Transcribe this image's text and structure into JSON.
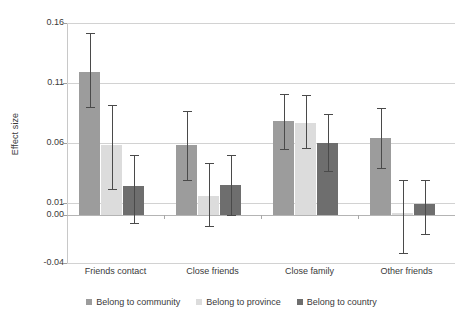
{
  "chart_data": {
    "type": "bar",
    "title": "",
    "xlabel": "",
    "ylabel": "Effect size",
    "categories": [
      "Friends contact",
      "Close friends",
      "Close family",
      "Other friends"
    ],
    "yticks": [
      "0.16",
      "0.11",
      "0.06",
      "0.01",
      "0.00",
      "-0.04"
    ],
    "ytick_values": [
      0.16,
      0.11,
      0.06,
      0.01,
      0.0,
      -0.04
    ],
    "ylim": [
      -0.04,
      0.16
    ],
    "grid": true,
    "legend_position": "bottom",
    "error_bars": "95% confidence interval",
    "series": [
      {
        "name": "Belong to community",
        "color": "#9c9c9c",
        "values": [
          0.119,
          0.058,
          0.078,
          0.064
        ],
        "ci_low": [
          0.09,
          0.029,
          0.055,
          0.039
        ],
        "ci_high": [
          0.152,
          0.087,
          0.101,
          0.089
        ]
      },
      {
        "name": "Belong to province",
        "color": "#dcdcdc",
        "values": [
          0.058,
          0.016,
          0.077,
          0.002
        ],
        "ci_low": [
          0.022,
          -0.009,
          0.056,
          -0.032
        ],
        "ci_high": [
          0.092,
          0.043,
          0.1,
          0.029
        ]
      },
      {
        "name": "Belong to country",
        "color": "#6e6e6e",
        "values": [
          0.024,
          0.025,
          0.06,
          0.009
        ],
        "ci_low": [
          -0.007,
          0.0,
          0.037,
          -0.016
        ],
        "ci_high": [
          0.05,
          0.05,
          0.084,
          0.029
        ]
      }
    ]
  },
  "axis": {
    "y_title": "Effect size"
  },
  "legend": {
    "items": [
      {
        "label": "Belong to community",
        "color": "#9c9c9c"
      },
      {
        "label": "Belong to province",
        "color": "#dcdcdc"
      },
      {
        "label": "Belong to country",
        "color": "#6e6e6e"
      }
    ]
  }
}
